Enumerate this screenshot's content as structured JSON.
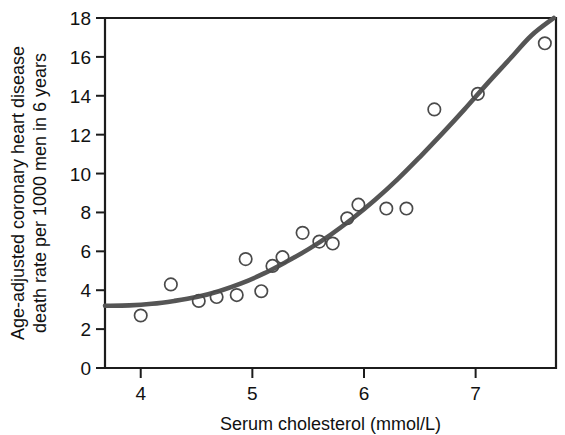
{
  "chart_data": {
    "type": "scatter",
    "title": "",
    "subtitle": "",
    "xlabel": "Serum cholesterol (mmol/L)",
    "ylabel": "Age-adjusted coronary heart disease death rate per 1000 men in 6 years",
    "ylabel_line1": "Age-adjusted coronary heart disease",
    "ylabel_line2": "death rate per 1000 men in 6 years",
    "xlim": [
      3.68,
      7.72
    ],
    "ylim": [
      0,
      18
    ],
    "xticks": [
      4,
      5,
      6,
      7
    ],
    "xtick_labels": [
      "4",
      "5",
      "6",
      "7"
    ],
    "yticks": [
      0,
      2,
      4,
      6,
      8,
      10,
      12,
      14,
      16,
      18
    ],
    "ytick_labels": [
      "0",
      "2",
      "4",
      "6",
      "8",
      "10",
      "12",
      "14",
      "16",
      "18"
    ],
    "grid": false,
    "legend": "none",
    "marker": "open-circle",
    "marker_color": "#4a4a4a",
    "curve_color": "#555555",
    "axis_color": "#1c1c1c",
    "background": "#ffffff",
    "points": [
      {
        "x": 4.0,
        "y": 2.7
      },
      {
        "x": 4.27,
        "y": 4.3
      },
      {
        "x": 4.52,
        "y": 3.45
      },
      {
        "x": 4.68,
        "y": 3.65
      },
      {
        "x": 4.86,
        "y": 3.75
      },
      {
        "x": 4.94,
        "y": 5.6
      },
      {
        "x": 5.08,
        "y": 3.95
      },
      {
        "x": 5.18,
        "y": 5.25
      },
      {
        "x": 5.27,
        "y": 5.7
      },
      {
        "x": 5.45,
        "y": 6.95
      },
      {
        "x": 5.6,
        "y": 6.5
      },
      {
        "x": 5.72,
        "y": 6.4
      },
      {
        "x": 5.85,
        "y": 7.7
      },
      {
        "x": 5.95,
        "y": 8.4
      },
      {
        "x": 6.2,
        "y": 8.2
      },
      {
        "x": 6.38,
        "y": 8.2
      },
      {
        "x": 6.63,
        "y": 13.3
      },
      {
        "x": 7.02,
        "y": 14.1
      },
      {
        "x": 7.62,
        "y": 16.7
      }
    ],
    "curve": [
      {
        "x": 3.68,
        "y": 3.2
      },
      {
        "x": 3.9,
        "y": 3.22
      },
      {
        "x": 4.1,
        "y": 3.3
      },
      {
        "x": 4.3,
        "y": 3.45
      },
      {
        "x": 4.5,
        "y": 3.65
      },
      {
        "x": 4.7,
        "y": 3.95
      },
      {
        "x": 4.9,
        "y": 4.35
      },
      {
        "x": 5.1,
        "y": 4.85
      },
      {
        "x": 5.3,
        "y": 5.45
      },
      {
        "x": 5.5,
        "y": 6.1
      },
      {
        "x": 5.7,
        "y": 6.85
      },
      {
        "x": 5.9,
        "y": 7.7
      },
      {
        "x": 6.1,
        "y": 8.65
      },
      {
        "x": 6.3,
        "y": 9.7
      },
      {
        "x": 6.5,
        "y": 10.85
      },
      {
        "x": 6.7,
        "y": 12.05
      },
      {
        "x": 6.9,
        "y": 13.3
      },
      {
        "x": 7.1,
        "y": 14.6
      },
      {
        "x": 7.3,
        "y": 15.85
      },
      {
        "x": 7.5,
        "y": 17.1
      },
      {
        "x": 7.7,
        "y": 18.0
      }
    ]
  }
}
